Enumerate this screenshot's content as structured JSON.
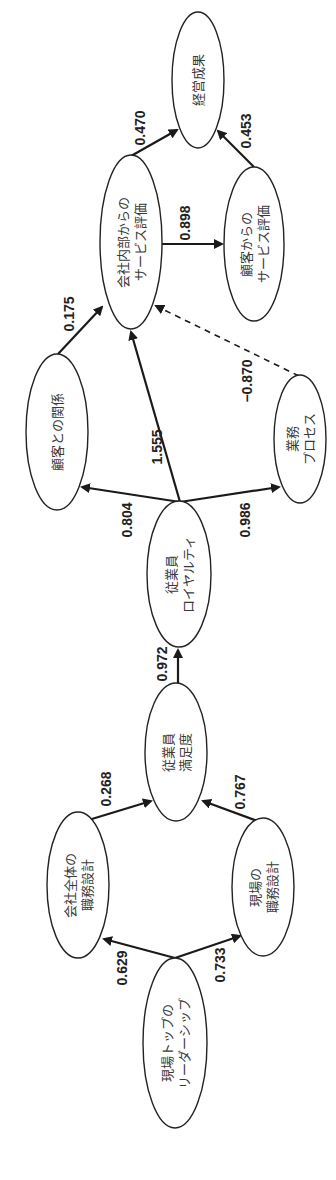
{
  "diagram": {
    "type": "path-model",
    "orientation": "rotated-90-ccw",
    "nodes": [
      {
        "id": "leadership",
        "lines": [
          "現場トップの",
          "リーダーシップ"
        ],
        "label": "現場トップのリーダーシップ"
      },
      {
        "id": "company_job_design",
        "lines": [
          "会社全体の",
          "職務設計"
        ],
        "label": "会社全体の職務設計"
      },
      {
        "id": "site_job_design",
        "lines": [
          "現場の",
          "職務設計"
        ],
        "label": "現場の職務設計"
      },
      {
        "id": "employee_satisfaction",
        "lines": [
          "従業員",
          "満足度"
        ],
        "label": "従業員満足度"
      },
      {
        "id": "employee_loyalty",
        "lines": [
          "従業員",
          "ロイヤルティ"
        ],
        "label": "従業員ロイヤルティ"
      },
      {
        "id": "customer_relationship",
        "lines": [
          "顧客との関係"
        ],
        "label": "顧客との関係"
      },
      {
        "id": "business_process",
        "lines": [
          "業務",
          "プロセス"
        ],
        "label": "業務プロセス"
      },
      {
        "id": "internal_service_eval",
        "lines": [
          "会社内部からの",
          "サービス評価"
        ],
        "label": "会社内部からのサービス評価"
      },
      {
        "id": "customer_service_eval",
        "lines": [
          "顧客からの",
          "サービス評価"
        ],
        "label": "顧客からのサービス評価"
      },
      {
        "id": "business_results",
        "lines": [
          "経営成果"
        ],
        "label": "経営成果"
      }
    ],
    "edges": [
      {
        "from": "leadership",
        "to": "company_job_design",
        "weight": "0.629",
        "style": "solid"
      },
      {
        "from": "leadership",
        "to": "site_job_design",
        "weight": "0.733",
        "style": "solid"
      },
      {
        "from": "company_job_design",
        "to": "employee_satisfaction",
        "weight": "0.268",
        "style": "solid"
      },
      {
        "from": "site_job_design",
        "to": "employee_satisfaction",
        "weight": "0.767",
        "style": "solid"
      },
      {
        "from": "employee_satisfaction",
        "to": "employee_loyalty",
        "weight": "0.972",
        "style": "solid"
      },
      {
        "from": "employee_loyalty",
        "to": "customer_relationship",
        "weight": "0.804",
        "style": "solid"
      },
      {
        "from": "employee_loyalty",
        "to": "business_process",
        "weight": "0.986",
        "style": "solid"
      },
      {
        "from": "employee_loyalty",
        "to": "internal_service_eval",
        "weight": "1.555",
        "style": "solid"
      },
      {
        "from": "customer_relationship",
        "to": "internal_service_eval",
        "weight": "0.175",
        "style": "solid"
      },
      {
        "from": "business_process",
        "to": "internal_service_eval",
        "weight": "−0.870",
        "style": "dashed"
      },
      {
        "from": "internal_service_eval",
        "to": "customer_service_eval",
        "weight": "0.898",
        "style": "solid"
      },
      {
        "from": "internal_service_eval",
        "to": "business_results",
        "weight": "0.470",
        "style": "solid"
      },
      {
        "from": "customer_service_eval",
        "to": "business_results",
        "weight": "0.453",
        "style": "solid"
      }
    ]
  },
  "colors": {
    "line": "#1a1a1a",
    "node_fill": "#ffffff",
    "text": "#3a3a3a"
  }
}
